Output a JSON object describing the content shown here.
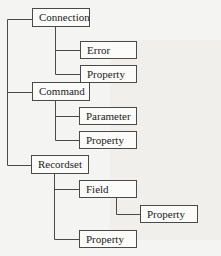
{
  "diagram": {
    "type": "tree",
    "title": "",
    "root_nodes": [
      {
        "label": "Connection",
        "children": [
          {
            "label": "Error"
          },
          {
            "label": "Property"
          }
        ]
      },
      {
        "label": "Command",
        "children": [
          {
            "label": "Parameter"
          },
          {
            "label": "Property"
          }
        ]
      },
      {
        "label": "Recordset",
        "children": [
          {
            "label": "Field",
            "children": [
              {
                "label": "Property"
              }
            ]
          },
          {
            "label": "Property"
          }
        ]
      }
    ],
    "colors": {
      "line": "#4a4a4a",
      "box_fill": "#fbfbfa",
      "background": "#f4f4f2"
    }
  }
}
